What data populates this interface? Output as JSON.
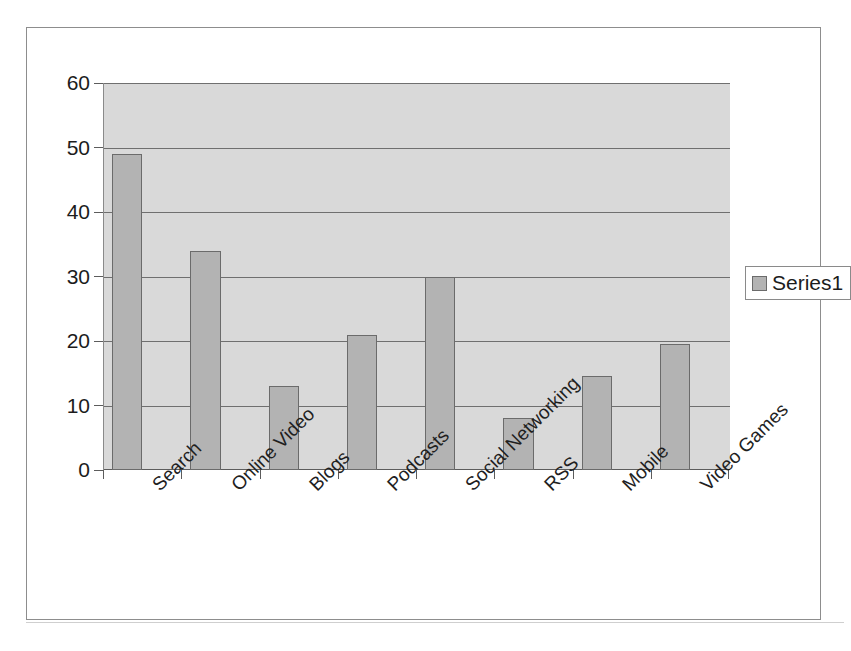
{
  "chart_data": {
    "type": "bar",
    "title": "",
    "xlabel": "",
    "ylabel": "",
    "categories": [
      "Search",
      "Online Video",
      "Blogs",
      "Podcasts",
      "Social Networking",
      "RSS",
      "Mobile",
      "Video Games"
    ],
    "series": [
      {
        "name": "Series1",
        "values": [
          49,
          34,
          13,
          21,
          30,
          8,
          14.5,
          19.5
        ]
      }
    ],
    "ylim": [
      0,
      60
    ],
    "yticks": [
      0,
      10,
      20,
      30,
      40,
      50,
      60
    ],
    "ytick_labels": [
      "0",
      "10",
      "20",
      "30",
      "40",
      "50",
      "60"
    ],
    "grid": true,
    "grid_axis": "y",
    "legend": {
      "position": "right",
      "entries": [
        {
          "label": "Series1",
          "color": "#b3b3b3"
        }
      ]
    },
    "colors": {
      "bar_fill": "#b3b3b3",
      "bar_border": "#6b6b6b",
      "plot_background": "#d9d9d9",
      "gridline": "#6f6f6f",
      "axis": "#5c5c5c",
      "frame_border": "#8d8d8d",
      "text": "#1c1c1c"
    },
    "xlabel_rotation_deg": -45
  }
}
